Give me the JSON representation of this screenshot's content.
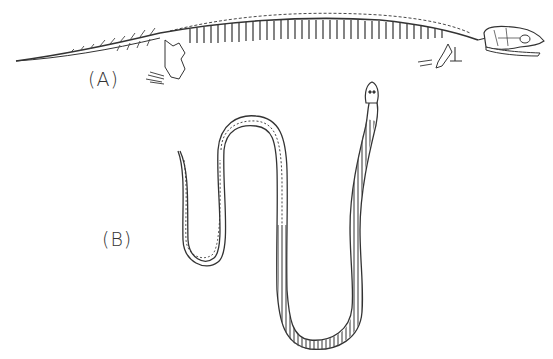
{
  "figure": {
    "panels": [
      {
        "id": "A",
        "label": "(A)",
        "subject": "elongated tetrapod skeleton with reduced limbs (lateral view)"
      },
      {
        "id": "B",
        "label": "(B)",
        "subject": "snake skeleton (dorsal view), serpentine body with ribbed vertebral column"
      }
    ]
  },
  "colors": {
    "ink": "#333333",
    "background": "#ffffff"
  }
}
